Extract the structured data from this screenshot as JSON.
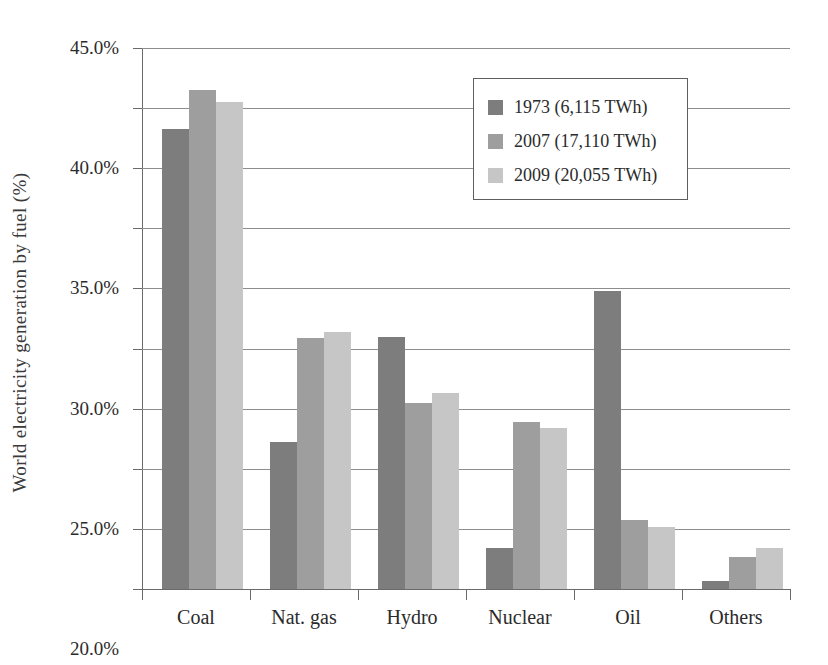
{
  "chart_data": {
    "type": "bar",
    "title": "",
    "subtitle": "",
    "xlabel": "",
    "ylabel": "World electricity generation by fuel (%)",
    "categories": [
      "Coal",
      "Nat. gas",
      "Hydro",
      "Nuclear",
      "Oil",
      "Others"
    ],
    "series": [
      {
        "name": "1973 (6,115 TWh)",
        "color": "#7d7d7d",
        "values": [
          38.3,
          12.2,
          21.0,
          3.4,
          24.8,
          0.7
        ]
      },
      {
        "name": "2007 (17,110 TWh)",
        "color": "#9e9e9e",
        "values": [
          41.5,
          20.9,
          15.5,
          13.9,
          5.7,
          2.7
        ]
      },
      {
        "name": "2009 (20,055 TWh)",
        "color": "#c6c6c6",
        "values": [
          40.5,
          21.4,
          16.3,
          13.4,
          5.2,
          3.4
        ]
      }
    ],
    "ylim": [
      0,
      45
    ],
    "ytick_values": [
      0,
      5,
      10,
      15,
      20,
      25,
      30,
      35,
      40,
      45
    ],
    "ytick_labels": [
      "0.0%",
      "5.0%",
      "10.0%",
      "15.0%",
      "20.0%",
      "25.0%",
      "30.0%",
      "35.0%",
      "40.0%",
      "45.0%"
    ],
    "grid": true,
    "grid_axis": "y",
    "legend_position": "upper-right-inside"
  },
  "legend": {
    "entries": [
      {
        "label": "1973 (6,115 TWh)"
      },
      {
        "label": "2007 (17,110 TWh)"
      },
      {
        "label": "2009 (20,055 TWh)"
      }
    ]
  }
}
